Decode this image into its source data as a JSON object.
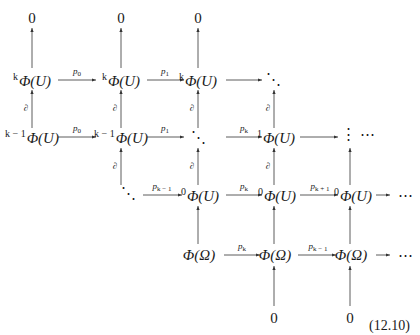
{
  "diagram": {
    "equation_number": "(12.10)",
    "boundary_label": "∂",
    "rows": [
      {
        "name": "top-zeros",
        "nodes": [
          "0",
          "0",
          "0"
        ]
      },
      {
        "name": "k-row",
        "nodes": [
          {
            "sup": "k",
            "body": "Φ(U)"
          },
          {
            "sup": "k",
            "body": "Φ(U)"
          },
          {
            "sup": "k",
            "body": "Φ(U)"
          },
          {
            "body": "⋱"
          }
        ],
        "arrows": [
          "p0",
          "p1",
          ""
        ]
      },
      {
        "name": "k-1-row",
        "nodes": [
          {
            "sup": "k − 1",
            "body": "Φ(U)"
          },
          {
            "sup": "k − 1",
            "body": "Φ(U)"
          },
          {
            "body": "⋱"
          },
          {
            "sup": "1",
            "body": "Φ(U)"
          },
          {
            "body": "⋮ ⋯"
          }
        ],
        "arrows": [
          "p0",
          "p1",
          "pk",
          ""
        ]
      },
      {
        "name": "0-row",
        "nodes": [
          {
            "body": "⋱"
          },
          {
            "sup": "0",
            "body": "Φ(U)"
          },
          {
            "sup": "0",
            "body": "Φ(U)"
          },
          {
            "sup": "0",
            "body": "Φ(U)"
          },
          {
            "body": "⋯"
          }
        ],
        "arrows": [
          "pk−1",
          "pk",
          "pk+1",
          ""
        ]
      },
      {
        "name": "omega-row",
        "nodes": [
          {
            "body": "Φ(Ω)"
          },
          {
            "body": "Φ(Ω)"
          },
          {
            "body": "Φ(Ω)"
          },
          {
            "body": "⋯"
          }
        ],
        "arrows": [
          "pk",
          "pk−1",
          ""
        ]
      },
      {
        "name": "bottom-zeros",
        "nodes": [
          "0",
          "0"
        ]
      }
    ],
    "labels": {
      "k": "k",
      "km1": "k − 1",
      "one": "1",
      "zero_sup": "0",
      "phiU": "Φ(U)",
      "phiO": "Φ(Ω)",
      "ddots": "⋱",
      "vdots": "⋮",
      "cdots": "⋯",
      "zero": "0",
      "p": "p",
      "sub0": "0",
      "sub1": "1",
      "subk": "k",
      "subkm1": "k − 1",
      "subkp1": "k + 1"
    }
  }
}
